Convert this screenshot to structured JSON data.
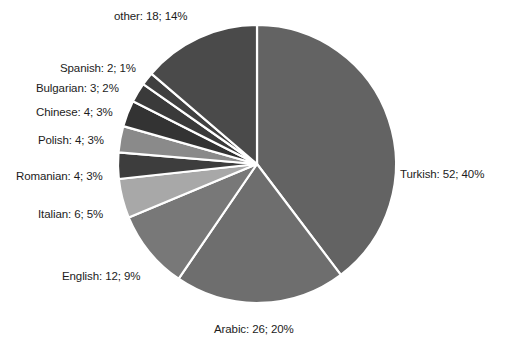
{
  "chart_data": {
    "type": "pie",
    "title": "",
    "subtitle": "",
    "xlabel": "",
    "ylabel": "",
    "grid": false,
    "legend_position": "outside-labels",
    "total": 131,
    "start_angle_deg": 0,
    "direction": "clockwise",
    "categories": [
      "Turkish",
      "Arabic",
      "English",
      "Italian",
      "Romanian",
      "Polish",
      "Chinese",
      "Bulgarian",
      "Spanish",
      "other"
    ],
    "values": [
      52,
      26,
      12,
      6,
      4,
      4,
      4,
      3,
      2,
      18
    ],
    "percents": [
      40,
      20,
      9,
      5,
      3,
      3,
      3,
      2,
      1,
      14
    ],
    "labels": [
      "Turkish: 52; 40%",
      "Arabic: 26; 20%",
      "English: 12; 9%",
      "Italian: 6; 5%",
      "Romanian: 4; 3%",
      "Polish: 4; 3%",
      "Chinese: 4; 3%",
      "Bulgarian: 3; 2%",
      "Spanish: 2; 1%",
      "other: 18; 14%"
    ],
    "colors": [
      "#636363",
      "#6e6e6e",
      "#787878",
      "#a8a8a8",
      "#3d3d3d",
      "#8a8a8a",
      "#333333",
      "#3a3a3a",
      "#404040",
      "#4a4a4a"
    ],
    "slice_separator_color": "#ffffff",
    "background_color": "#ffffff",
    "label_text_color": "#1c1c1c"
  },
  "geometry": {
    "center_x": 257,
    "center_y": 164,
    "radius": 139
  },
  "label_positions": [
    {
      "key": "turkish",
      "x": 400,
      "y": 168,
      "align": "lbl-right"
    },
    {
      "key": "arabic",
      "x": 214,
      "y": 323,
      "align": "lbl-center"
    },
    {
      "key": "english",
      "x": 62,
      "y": 270,
      "align": "lbl-left"
    },
    {
      "key": "italian",
      "x": 38,
      "y": 208,
      "align": "lbl-left"
    },
    {
      "key": "romanian",
      "x": 16,
      "y": 170,
      "align": "lbl-left"
    },
    {
      "key": "polish",
      "x": 38,
      "y": 134,
      "align": "lbl-left"
    },
    {
      "key": "chinese",
      "x": 36,
      "y": 106,
      "align": "lbl-left"
    },
    {
      "key": "bulgarian",
      "x": 36,
      "y": 82,
      "align": "lbl-left"
    },
    {
      "key": "spanish",
      "x": 60,
      "y": 62,
      "align": "lbl-left"
    },
    {
      "key": "other",
      "x": 114,
      "y": 10,
      "align": "lbl-left"
    }
  ]
}
